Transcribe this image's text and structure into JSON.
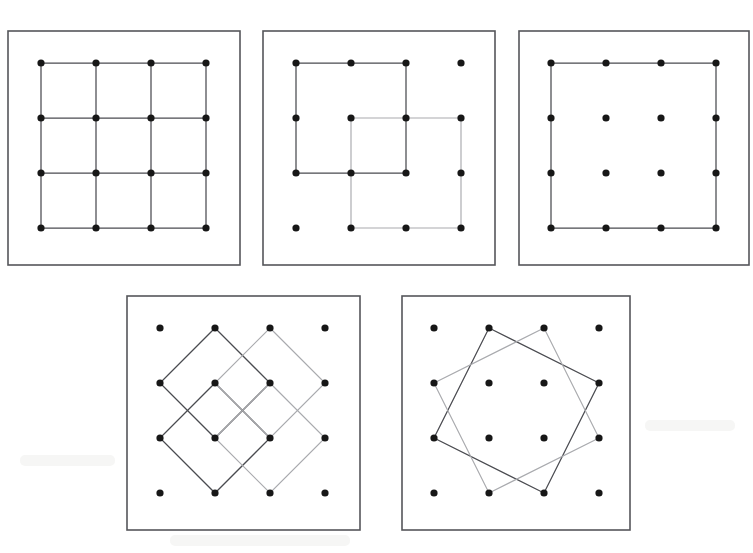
{
  "figure": {
    "title": "",
    "background_color": "#ffffff",
    "dot_color": "#171717",
    "frame_color": "#55565a",
    "dark_line_color": "#4a4b50",
    "light_line_color": "#a9aaae",
    "panel_count": 5,
    "grid_label": "4 x 4 dot lattice"
  },
  "chart_data": {
    "type": "diagram",
    "grid": {
      "cols": 4,
      "rows": 4,
      "index_origin": "top-left",
      "coord_format": "[col,row]"
    },
    "panels": [
      {
        "id": "panel-1",
        "label": "1",
        "frame": {
          "x": 8,
          "y": 31,
          "width": 232,
          "height": 234
        },
        "dot_origin": {
          "x": 41,
          "y": 63
        },
        "dot_spacing": 55,
        "dots": [
          [
            0,
            0
          ],
          [
            1,
            0
          ],
          [
            2,
            0
          ],
          [
            3,
            0
          ],
          [
            0,
            1
          ],
          [
            1,
            1
          ],
          [
            2,
            1
          ],
          [
            3,
            1
          ],
          [
            0,
            2
          ],
          [
            1,
            2
          ],
          [
            2,
            2
          ],
          [
            3,
            2
          ],
          [
            0,
            3
          ],
          [
            1,
            3
          ],
          [
            2,
            3
          ],
          [
            3,
            3
          ]
        ],
        "shapes": [
          {
            "name": "grid-lines-horizontal",
            "style": "dark",
            "type": "polyline",
            "points": [
              [
                0,
                0
              ],
              [
                3,
                0
              ]
            ]
          },
          {
            "name": "grid-lines-horizontal",
            "style": "dark",
            "type": "polyline",
            "points": [
              [
                0,
                1
              ],
              [
                3,
                1
              ]
            ]
          },
          {
            "name": "grid-lines-horizontal",
            "style": "dark",
            "type": "polyline",
            "points": [
              [
                0,
                2
              ],
              [
                3,
                2
              ]
            ]
          },
          {
            "name": "grid-lines-horizontal",
            "style": "dark",
            "type": "polyline",
            "points": [
              [
                0,
                3
              ],
              [
                3,
                3
              ]
            ]
          },
          {
            "name": "grid-lines-vertical",
            "style": "dark",
            "type": "polyline",
            "points": [
              [
                0,
                0
              ],
              [
                0,
                3
              ]
            ]
          },
          {
            "name": "grid-lines-vertical",
            "style": "dark",
            "type": "polyline",
            "points": [
              [
                1,
                0
              ],
              [
                1,
                3
              ]
            ]
          },
          {
            "name": "grid-lines-vertical",
            "style": "dark",
            "type": "polyline",
            "points": [
              [
                2,
                0
              ],
              [
                2,
                3
              ]
            ]
          },
          {
            "name": "grid-lines-vertical",
            "style": "dark",
            "type": "polyline",
            "points": [
              [
                3,
                0
              ],
              [
                3,
                3
              ]
            ]
          }
        ],
        "description": "Full 3x3 arrangement of unit squares covering the whole lattice"
      },
      {
        "id": "panel-2",
        "label": "2",
        "frame": {
          "x": 263,
          "y": 31,
          "width": 232,
          "height": 234
        },
        "dot_origin": {
          "x": 296,
          "y": 63
        },
        "dot_spacing": 55,
        "dots": [
          [
            0,
            0
          ],
          [
            1,
            0
          ],
          [
            2,
            0
          ],
          [
            3,
            0
          ],
          [
            0,
            1
          ],
          [
            1,
            1
          ],
          [
            2,
            1
          ],
          [
            3,
            1
          ],
          [
            0,
            2
          ],
          [
            1,
            2
          ],
          [
            2,
            2
          ],
          [
            3,
            2
          ],
          [
            0,
            3
          ],
          [
            1,
            3
          ],
          [
            2,
            3
          ],
          [
            3,
            3
          ]
        ],
        "shapes": [
          {
            "name": "square-upper-left",
            "style": "dark",
            "type": "polygon",
            "points": [
              [
                0,
                0
              ],
              [
                2,
                0
              ],
              [
                2,
                2
              ],
              [
                0,
                2
              ]
            ]
          },
          {
            "name": "square-center",
            "style": "light",
            "type": "polygon",
            "points": [
              [
                1,
                1
              ],
              [
                3,
                1
              ],
              [
                3,
                3
              ],
              [
                1,
                3
              ]
            ]
          }
        ],
        "description": "Two overlapping 2x2 squares offset by one lattice step"
      },
      {
        "id": "panel-3",
        "label": "3",
        "frame": {
          "x": 519,
          "y": 31,
          "width": 230,
          "height": 234
        },
        "dot_origin": {
          "x": 551,
          "y": 63
        },
        "dot_spacing": 55,
        "dots": [
          [
            0,
            0
          ],
          [
            1,
            0
          ],
          [
            2,
            0
          ],
          [
            3,
            0
          ],
          [
            0,
            1
          ],
          [
            1,
            1
          ],
          [
            2,
            1
          ],
          [
            3,
            1
          ],
          [
            0,
            2
          ],
          [
            1,
            2
          ],
          [
            2,
            2
          ],
          [
            3,
            2
          ],
          [
            0,
            3
          ],
          [
            1,
            3
          ],
          [
            2,
            3
          ],
          [
            3,
            3
          ]
        ],
        "shapes": [
          {
            "name": "square-outer",
            "style": "dark",
            "type": "polygon",
            "points": [
              [
                0,
                0
              ],
              [
                3,
                0
              ],
              [
                3,
                3
              ],
              [
                0,
                3
              ]
            ]
          }
        ],
        "description": "Single 3x3 square joining the four corner dots"
      },
      {
        "id": "panel-4",
        "label": "4",
        "frame": {
          "x": 127,
          "y": 296,
          "width": 233,
          "height": 234
        },
        "dot_origin": {
          "x": 160,
          "y": 328
        },
        "dot_spacing": 55,
        "dots": [
          [
            0,
            0
          ],
          [
            1,
            0
          ],
          [
            2,
            0
          ],
          [
            3,
            0
          ],
          [
            0,
            1
          ],
          [
            1,
            1
          ],
          [
            2,
            1
          ],
          [
            3,
            1
          ],
          [
            0,
            2
          ],
          [
            1,
            2
          ],
          [
            2,
            2
          ],
          [
            3,
            2
          ],
          [
            0,
            3
          ],
          [
            1,
            3
          ],
          [
            2,
            3
          ],
          [
            3,
            3
          ]
        ],
        "shapes": [
          {
            "name": "diamond-upper-left",
            "style": "dark",
            "type": "polygon",
            "points": [
              [
                1,
                0
              ],
              [
                2,
                1
              ],
              [
                1,
                2
              ],
              [
                0,
                1
              ]
            ]
          },
          {
            "name": "diamond-lower-left",
            "style": "dark",
            "type": "polygon",
            "points": [
              [
                1,
                1
              ],
              [
                2,
                2
              ],
              [
                1,
                3
              ],
              [
                0,
                2
              ]
            ]
          },
          {
            "name": "diamond-large-right",
            "style": "light",
            "type": "polygon",
            "points": [
              [
                2,
                0
              ],
              [
                3,
                1
              ],
              [
                2,
                2
              ],
              [
                1,
                1
              ]
            ]
          },
          {
            "name": "diamond-lower-right",
            "style": "light",
            "type": "polygon",
            "points": [
              [
                2,
                1
              ],
              [
                3,
                2
              ],
              [
                2,
                3
              ],
              [
                1,
                2
              ]
            ]
          }
        ],
        "description": "Four tilted unit squares (diamonds) rotated 45 degrees, overlapping"
      },
      {
        "id": "panel-5",
        "label": "5",
        "frame": {
          "x": 402,
          "y": 296,
          "width": 228,
          "height": 234
        },
        "dot_origin": {
          "x": 434,
          "y": 328
        },
        "dot_spacing": 55,
        "dots": [
          [
            0,
            0
          ],
          [
            1,
            0
          ],
          [
            2,
            0
          ],
          [
            3,
            0
          ],
          [
            0,
            1
          ],
          [
            1,
            1
          ],
          [
            2,
            1
          ],
          [
            3,
            1
          ],
          [
            0,
            2
          ],
          [
            1,
            2
          ],
          [
            2,
            2
          ],
          [
            3,
            2
          ],
          [
            0,
            3
          ],
          [
            1,
            3
          ],
          [
            2,
            3
          ],
          [
            3,
            3
          ]
        ],
        "shapes": [
          {
            "name": "square-tilted-clockwise",
            "style": "dark",
            "type": "polygon",
            "points": [
              [
                1,
                0
              ],
              [
                3,
                1
              ],
              [
                2,
                3
              ],
              [
                0,
                2
              ]
            ]
          },
          {
            "name": "square-tilted-counterclockwise",
            "style": "light",
            "type": "polygon",
            "points": [
              [
                2,
                0
              ],
              [
                3,
                2
              ],
              [
                1,
                3
              ],
              [
                0,
                1
              ]
            ]
          }
        ],
        "description": "Two congruent tilted squares of side sqrt(5), mirror images of one another"
      }
    ]
  }
}
